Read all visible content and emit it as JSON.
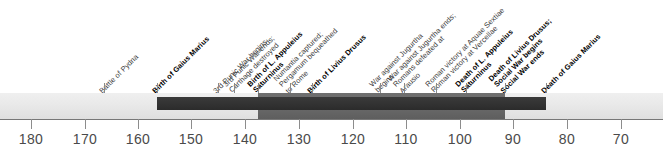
{
  "figure": {
    "type": "timeline",
    "title": "",
    "axis": {
      "label": "",
      "direction": "descending-bce-years",
      "ticks": [
        {
          "value": "180",
          "x": 31
        },
        {
          "value": "170",
          "x": 85
        },
        {
          "value": "160",
          "x": 138
        },
        {
          "value": "150",
          "x": 191
        },
        {
          "value": "140",
          "x": 245
        },
        {
          "value": "130",
          "x": 299
        },
        {
          "value": "120",
          "x": 353
        },
        {
          "value": "110",
          "x": 406
        },
        {
          "value": "100",
          "x": 460
        },
        {
          "value": "90",
          "x": 513
        },
        {
          "value": "80",
          "x": 567
        },
        {
          "value": "70",
          "x": 621
        }
      ]
    },
    "bands": [
      {
        "name": "base-band",
        "color": "#e9e9e9",
        "left": 0,
        "width": 663
      },
      {
        "name": "mid-band",
        "color": "#6a6a6a",
        "left": 258,
        "width": 247
      },
      {
        "name": "dark-band",
        "color": "#333333",
        "left": 157,
        "width": 389
      }
    ],
    "events": [
      {
        "id": "battle-of-pydna",
        "label": [
          "Battle of Pydna"
        ],
        "bold": false,
        "x": 104
      },
      {
        "id": "birth-of-gaius-marius",
        "label": [
          "Birth of Gaius Marius"
        ],
        "bold": true,
        "x": 157
      },
      {
        "id": "3rd-punic-war-begins",
        "label": [
          "3rd Punic War begins"
        ],
        "bold": false,
        "x": 218
      },
      {
        "id": "3rd-punic-war-ends",
        "label": [
          "3rd Punic War ends;",
          "Carthage destroyed"
        ],
        "bold": false,
        "x": 234
      },
      {
        "id": "birth-of-l-appuleius-saturninus",
        "label": [
          "Birth of L. Appuleius",
          "Saturninus"
        ],
        "bold": true,
        "x": 258
      },
      {
        "id": "numantia-captured",
        "label": [
          "Numantia captured;",
          "Pergamum bequeathed",
          "to Rome"
        ],
        "bold": false,
        "x": 290
      },
      {
        "id": "birth-of-livius-drusus",
        "label": [
          "Birth of Livius Drusus"
        ],
        "bold": true,
        "x": 312
      },
      {
        "id": "war-against-jugurtha-begins",
        "label": [
          "War against Jugurtha",
          "begins"
        ],
        "bold": false,
        "x": 380
      },
      {
        "id": "war-against-jugurtha-ends",
        "label": [
          "War against Jugurtha ends;",
          "Romans defeated at",
          "Arausio"
        ],
        "bold": false,
        "x": 404
      },
      {
        "id": "roman-victory-aquae-sextiae",
        "label": [
          "Roman victory at Aquae Sextiae",
          "Roman victory at Vercellae"
        ],
        "bold": false,
        "x": 436
      },
      {
        "id": "death-of-l-appuleius-saturninus",
        "label": [
          "Death of L. Appuleius",
          "Saturninus"
        ],
        "bold": true,
        "x": 466
      },
      {
        "id": "death-of-livius-drusus",
        "label": [
          "Death of Livius Drusus;",
          "Social War begins",
          "Social War ends"
        ],
        "bold": true,
        "x": 505
      },
      {
        "id": "death-of-gaius-marius",
        "label": [
          "Death of Gaius Marius"
        ],
        "bold": true,
        "x": 546
      }
    ]
  }
}
